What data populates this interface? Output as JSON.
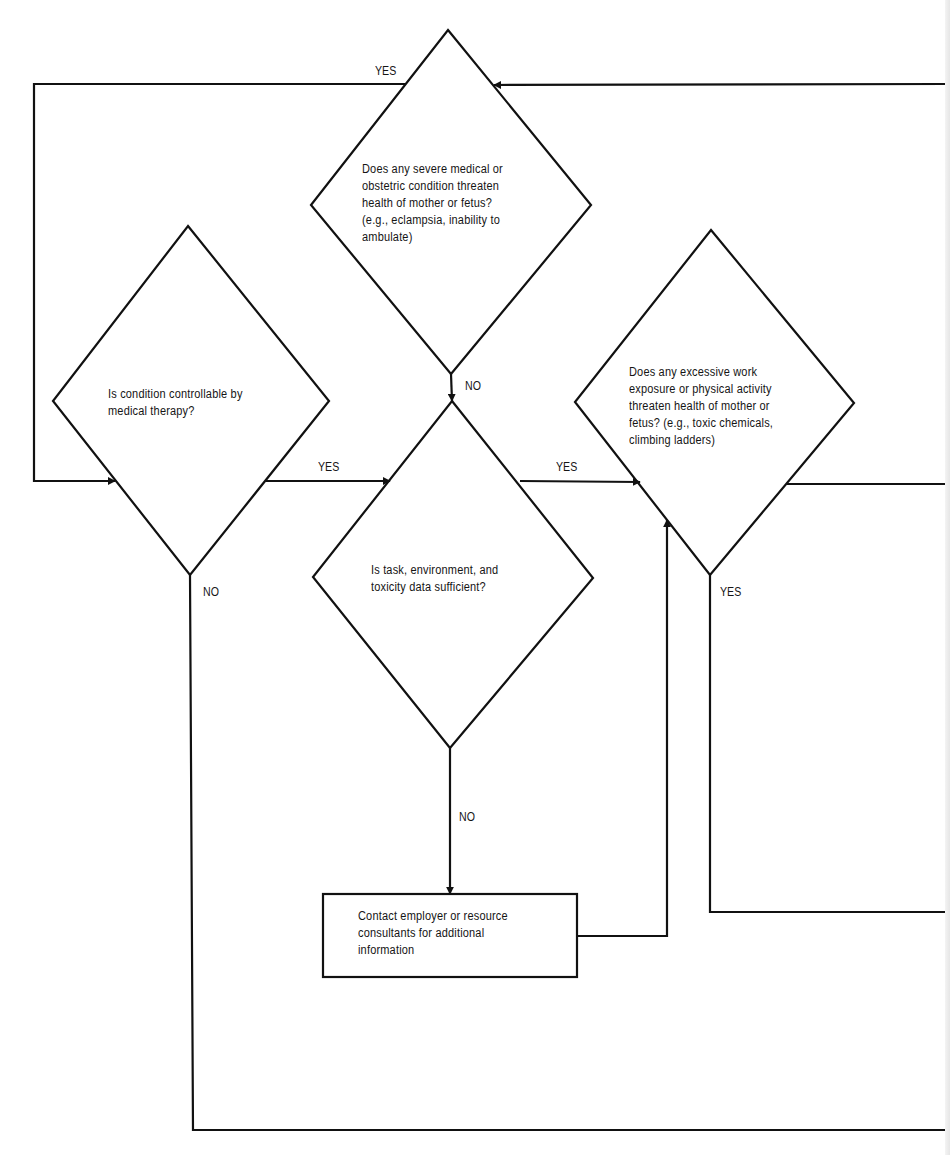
{
  "diagram": {
    "type": "flowchart",
    "nodes": {
      "severe_condition": {
        "shape": "diamond",
        "text": "Does any severe medical or\nobstetric condition threaten\nhealth of mother or fetus?\n(e.g., eclampsia, inability to\nambulate)"
      },
      "controllable": {
        "shape": "diamond",
        "text": "Is condition controllable by\nmedical therapy?"
      },
      "data_sufficient": {
        "shape": "diamond",
        "text": "Is task, environment, and\ntoxicity data sufficient?"
      },
      "work_exposure": {
        "shape": "diamond",
        "text": "Does any excessive work\nexposure or physical activity\nthreaten health of mother or\nfetus? (e.g., toxic chemicals,\nclimbing ladders)"
      },
      "contact_employer": {
        "shape": "rectangle",
        "text": "Contact employer or resource\nconsultants for additional\ninformation"
      }
    },
    "edge_labels": {
      "severe_yes": "YES",
      "severe_no": "NO",
      "controllable_yes": "YES",
      "controllable_no": "NO",
      "data_yes": "YES",
      "data_no": "NO",
      "work_yes": "YES"
    },
    "edges": [
      {
        "from": "severe_condition",
        "to": "controllable",
        "label": "YES"
      },
      {
        "from": "severe_condition",
        "to": "data_sufficient",
        "label": "NO"
      },
      {
        "from": "controllable",
        "to": "data_sufficient",
        "label": "YES"
      },
      {
        "from": "controllable",
        "to": "off-page",
        "label": "NO"
      },
      {
        "from": "data_sufficient",
        "to": "work_exposure",
        "label": "YES"
      },
      {
        "from": "data_sufficient",
        "to": "contact_employer",
        "label": "NO"
      },
      {
        "from": "contact_employer",
        "to": "work_exposure",
        "label": ""
      },
      {
        "from": "work_exposure",
        "to": "off-page",
        "label": "YES"
      },
      {
        "from": "work_exposure",
        "to": "off-page",
        "label": ""
      },
      {
        "from": "off-page",
        "to": "severe_condition",
        "label": ""
      }
    ],
    "colors": {
      "stroke": "#111111",
      "background": "#ffffff"
    }
  }
}
